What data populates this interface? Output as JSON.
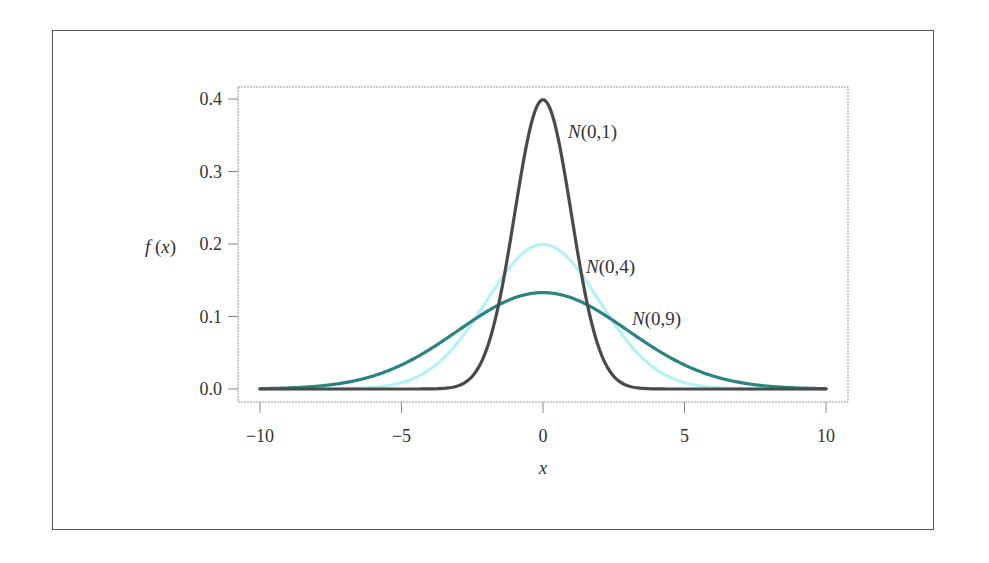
{
  "chart_data": {
    "type": "line",
    "title": "",
    "xlabel": "x",
    "ylabel": "f(x)",
    "xlim": [
      -10.8,
      10.8
    ],
    "ylim": [
      -0.018,
      0.414
    ],
    "x_ticks": [
      -10,
      -5,
      0,
      5,
      10
    ],
    "x_tick_labels": [
      "−10",
      "−5",
      "0",
      "5",
      "10"
    ],
    "y_ticks": [
      0.0,
      0.1,
      0.2,
      0.3,
      0.4
    ],
    "y_tick_labels": [
      "0.0",
      "0.1",
      "0.2",
      "0.3",
      "0.4"
    ],
    "grid": false,
    "legend": "inline curve labels",
    "series": [
      {
        "name": "N(0,1)",
        "label_main": "N",
        "label_args": "(0,1)",
        "mean": 0,
        "variance": 1,
        "sd": 1,
        "peak": 0.399,
        "color": "#4a4a4a",
        "x_range": [
          -10,
          10
        ]
      },
      {
        "name": "N(0,4)",
        "label_main": "N",
        "label_args": "(0,4)",
        "mean": 0,
        "variance": 4,
        "sd": 2,
        "peak": 0.199,
        "color": "#b3f3f5",
        "x_range": [
          -10,
          10
        ]
      },
      {
        "name": "N(0,9)",
        "label_main": "N",
        "label_args": "(0,9)",
        "mean": 0,
        "variance": 9,
        "sd": 3,
        "peak": 0.133,
        "color": "#2a8482",
        "x_range": [
          -10,
          10
        ]
      }
    ]
  }
}
